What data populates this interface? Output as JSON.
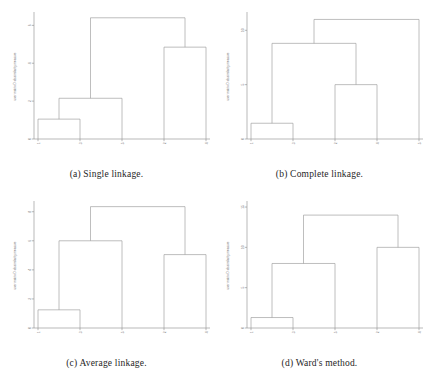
{
  "figure": {
    "panel_count": 4,
    "background_color": "#ffffff",
    "line_color": "#9a9a9a",
    "axis_color": "#8a8a8a"
  },
  "panels": [
    {
      "id": "a",
      "caption": "(a) Single linkage.",
      "ylabel": "user matrix D dissimilarity measure",
      "ytick_labels": [
        "0",
        "2",
        "4",
        "6"
      ],
      "xtick_labels": [
        "1",
        "3",
        "5",
        "2",
        "4"
      ]
    },
    {
      "id": "b",
      "caption": "(b) Complete linkage.",
      "ylabel": "user matrix D dissimilarity measure",
      "ytick_labels": [
        "0",
        "5",
        "10"
      ],
      "xtick_labels": [
        "1",
        "3",
        "2",
        "4",
        "5"
      ]
    },
    {
      "id": "c",
      "caption": "(c) Average linkage.",
      "ylabel": "user matrix D dissimilarity measure",
      "ytick_labels": [
        "0",
        "2",
        "4",
        "6",
        "8"
      ],
      "xtick_labels": [
        "1",
        "3",
        "5",
        "2",
        "4"
      ]
    },
    {
      "id": "d",
      "caption": "(d) Ward's method.",
      "ylabel": "user matrix D dissimilarity measure",
      "ytick_labels": [
        "0",
        "5",
        "10",
        "15"
      ],
      "xtick_labels": [
        "1",
        "3",
        "5",
        "2",
        "4"
      ]
    }
  ],
  "chart_data": [
    {
      "type": "line",
      "subtype": "dendrogram",
      "panel": "a",
      "title": "(a) Single linkage.",
      "xlabel": "",
      "ylabel": "user matrix D dissimilarity measure",
      "leaves": [
        "1",
        "3",
        "5",
        "2",
        "4"
      ],
      "ylim": [
        0,
        6.6
      ],
      "yticks": [
        0,
        2,
        4,
        6
      ],
      "grid": false,
      "merges": [
        {
          "left": "1",
          "right": "3",
          "height": 1.05
        },
        {
          "left": "(1,3)",
          "right": "5",
          "height": 2.15
        },
        {
          "left": "2",
          "right": "4",
          "height": 4.85
        },
        {
          "left": "(1,3,5)",
          "right": "(2,4)",
          "height": 6.4
        }
      ]
    },
    {
      "type": "line",
      "subtype": "dendrogram",
      "panel": "b",
      "title": "(b) Complete linkage.",
      "xlabel": "",
      "ylabel": "user matrix D dissimilarity measure",
      "leaves": [
        "1",
        "3",
        "2",
        "4",
        "5"
      ],
      "ylim": [
        0,
        11.5
      ],
      "yticks": [
        0,
        5,
        10
      ],
      "grid": false,
      "merges": [
        {
          "left": "1",
          "right": "3",
          "height": 1.45
        },
        {
          "left": "2",
          "right": "4",
          "height": 5.0
        },
        {
          "left": "(1,3)",
          "right": "(2,4)",
          "height": 8.8
        },
        {
          "left": "(1,3,2,4)",
          "right": "5",
          "height": 11.0
        }
      ]
    },
    {
      "type": "line",
      "subtype": "dendrogram",
      "panel": "c",
      "title": "(c) Average linkage.",
      "xlabel": "",
      "ylabel": "user matrix D dissimilarity measure",
      "leaves": [
        "1",
        "3",
        "5",
        "2",
        "4"
      ],
      "ylim": [
        0,
        8.6
      ],
      "yticks": [
        0,
        2,
        4,
        6,
        8
      ],
      "grid": false,
      "merges": [
        {
          "left": "1",
          "right": "3",
          "height": 1.25
        },
        {
          "left": "(1,3)",
          "right": "5",
          "height": 6.0
        },
        {
          "left": "2",
          "right": "4",
          "height": 5.05
        },
        {
          "left": "(1,3,5)",
          "right": "(2,4)",
          "height": 8.35
        }
      ]
    },
    {
      "type": "line",
      "subtype": "dendrogram",
      "panel": "d",
      "title": "(d) Ward's method.",
      "xlabel": "",
      "ylabel": "user matrix D dissimilarity measure",
      "leaves": [
        "1",
        "3",
        "5",
        "2",
        "4"
      ],
      "ylim": [
        0,
        15.5
      ],
      "yticks": [
        0,
        5,
        10,
        15
      ],
      "grid": false,
      "merges": [
        {
          "left": "1",
          "right": "3",
          "height": 1.3
        },
        {
          "left": "(1,3)",
          "right": "5",
          "height": 8.0
        },
        {
          "left": "2",
          "right": "4",
          "height": 10.0
        },
        {
          "left": "(1,3,5)",
          "right": "(2,4)",
          "height": 14.0
        }
      ]
    }
  ]
}
